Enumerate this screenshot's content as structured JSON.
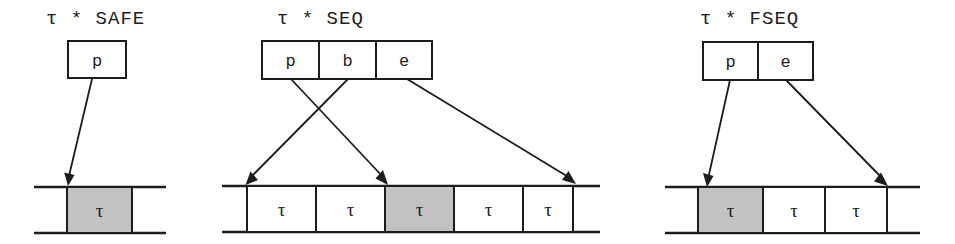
{
  "figure": {
    "title_separator": "*",
    "tau_symbol": "τ",
    "panels": [
      {
        "id": "safe",
        "title": "τ * SAFE",
        "descriptor_cells": [
          "p"
        ],
        "tape_cells": [
          {
            "label": "τ",
            "shaded": true
          }
        ],
        "arrows": [
          {
            "from_field": "p",
            "to_cell_index": 0,
            "target_edge": "left"
          }
        ]
      },
      {
        "id": "seq",
        "title": "τ * SEQ",
        "descriptor_cells": [
          "p",
          "b",
          "e"
        ],
        "tape_cells": [
          {
            "label": "τ",
            "shaded": false
          },
          {
            "label": "τ",
            "shaded": false
          },
          {
            "label": "τ",
            "shaded": true
          },
          {
            "label": "τ",
            "shaded": false
          },
          {
            "label": "τ",
            "shaded": false
          }
        ],
        "arrows": [
          {
            "from_field": "p",
            "to_cell_index": 2,
            "target_edge": "left"
          },
          {
            "from_field": "b",
            "to_cell_index": 0,
            "target_edge": "left"
          },
          {
            "from_field": "e",
            "to_cell_index": 4,
            "target_edge": "right"
          }
        ]
      },
      {
        "id": "fseq",
        "title": "τ * FSEQ",
        "descriptor_cells": [
          "p",
          "e"
        ],
        "tape_cells": [
          {
            "label": "τ",
            "shaded": true
          },
          {
            "label": "τ",
            "shaded": false
          },
          {
            "label": "τ",
            "shaded": false
          }
        ],
        "arrows": [
          {
            "from_field": "p",
            "to_cell_index": 0,
            "target_edge": "left"
          },
          {
            "from_field": "e",
            "to_cell_index": 2,
            "target_edge": "right"
          }
        ]
      }
    ],
    "colors": {
      "ink": "#1c1c1c",
      "shaded_cell": "#c2c2c2",
      "plain_cell": "#ffffff",
      "background": "#ffffff"
    }
  }
}
